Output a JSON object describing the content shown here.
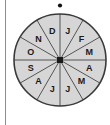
{
  "figure": {
    "type": "spinner-wheel",
    "name": "month-spinner",
    "sector_count": 12,
    "pointer": {
      "shape": "dot",
      "position": "top",
      "color": "#111111"
    },
    "hub": {
      "shape": "square",
      "color": "#1a1a1a"
    },
    "colors": {
      "sector_fill": "#d6d6d6",
      "outline": "#3a3a3a",
      "divider": "#555555",
      "label": "#1a1a1a",
      "rule": "#8d8d8d",
      "background": "#ffffff"
    },
    "geometry": {
      "center_x": 60,
      "center_y": 60,
      "radius": 46
    },
    "sectors": [
      {
        "label": "J",
        "month": "January",
        "index": 0,
        "angle_deg": 15
      },
      {
        "label": "F",
        "month": "February",
        "index": 1,
        "angle_deg": 45
      },
      {
        "label": "M",
        "month": "March",
        "index": 2,
        "angle_deg": 75
      },
      {
        "label": "A",
        "month": "April",
        "index": 3,
        "angle_deg": 105
      },
      {
        "label": "M",
        "month": "May",
        "index": 4,
        "angle_deg": 135
      },
      {
        "label": "J",
        "month": "June",
        "index": 5,
        "angle_deg": 165
      },
      {
        "label": "J",
        "month": "July",
        "index": 6,
        "angle_deg": 195
      },
      {
        "label": "A",
        "month": "August",
        "index": 7,
        "angle_deg": 225
      },
      {
        "label": "S",
        "month": "September",
        "index": 8,
        "angle_deg": 255
      },
      {
        "label": "O",
        "month": "October",
        "index": 9,
        "angle_deg": 285
      },
      {
        "label": "N",
        "month": "November",
        "index": 10,
        "angle_deg": 315
      },
      {
        "label": "D",
        "month": "December",
        "index": 11,
        "angle_deg": 345
      }
    ]
  }
}
